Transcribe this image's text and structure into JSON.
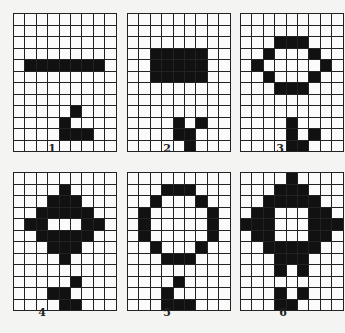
{
  "diagram": {
    "cols": 9,
    "rows": 12,
    "panels": [
      {
        "label": "1",
        "x": 13,
        "y": 13,
        "label_x": 52,
        "label_y": 150,
        "filled": [
          [
            4,
            1
          ],
          [
            4,
            2
          ],
          [
            4,
            3
          ],
          [
            4,
            4
          ],
          [
            4,
            5
          ],
          [
            4,
            6
          ],
          [
            4,
            7
          ],
          [
            8,
            5
          ],
          [
            9,
            4
          ],
          [
            10,
            4
          ],
          [
            10,
            5
          ],
          [
            10,
            6
          ]
        ]
      },
      {
        "label": "2",
        "x": 127,
        "y": 13,
        "label_x": 167,
        "label_y": 150,
        "filled": [
          [
            3,
            2
          ],
          [
            3,
            3
          ],
          [
            3,
            4
          ],
          [
            3,
            5
          ],
          [
            3,
            6
          ],
          [
            4,
            2
          ],
          [
            4,
            3
          ],
          [
            4,
            4
          ],
          [
            4,
            5
          ],
          [
            4,
            6
          ],
          [
            5,
            2
          ],
          [
            5,
            3
          ],
          [
            5,
            4
          ],
          [
            5,
            5
          ],
          [
            5,
            6
          ],
          [
            9,
            4
          ],
          [
            9,
            6
          ],
          [
            10,
            4
          ],
          [
            10,
            5
          ],
          [
            11,
            5
          ]
        ]
      },
      {
        "label": "3",
        "x": 240,
        "y": 13,
        "label_x": 280,
        "label_y": 150,
        "filled": [
          [
            2,
            3
          ],
          [
            2,
            4
          ],
          [
            2,
            5
          ],
          [
            3,
            2
          ],
          [
            3,
            6
          ],
          [
            4,
            1
          ],
          [
            4,
            7
          ],
          [
            5,
            2
          ],
          [
            5,
            6
          ],
          [
            6,
            3
          ],
          [
            6,
            4
          ],
          [
            6,
            5
          ],
          [
            9,
            4
          ],
          [
            10,
            4
          ],
          [
            10,
            6
          ],
          [
            11,
            4
          ],
          [
            11,
            5
          ]
        ]
      },
      {
        "label": "4",
        "x": 13,
        "y": 172,
        "label_x": 42,
        "label_y": 314,
        "filled": [
          [
            1,
            4
          ],
          [
            2,
            3
          ],
          [
            2,
            4
          ],
          [
            2,
            5
          ],
          [
            3,
            2
          ],
          [
            3,
            3
          ],
          [
            3,
            4
          ],
          [
            3,
            5
          ],
          [
            3,
            6
          ],
          [
            4,
            1
          ],
          [
            4,
            2
          ],
          [
            4,
            6
          ],
          [
            4,
            7
          ],
          [
            5,
            2
          ],
          [
            5,
            3
          ],
          [
            5,
            4
          ],
          [
            5,
            5
          ],
          [
            5,
            6
          ],
          [
            6,
            3
          ],
          [
            6,
            4
          ],
          [
            6,
            5
          ],
          [
            7,
            4
          ],
          [
            9,
            5
          ],
          [
            10,
            3
          ],
          [
            10,
            4
          ],
          [
            11,
            4
          ],
          [
            11,
            5
          ]
        ]
      },
      {
        "label": "5",
        "x": 127,
        "y": 172,
        "label_x": 167,
        "label_y": 314,
        "filled": [
          [
            1,
            3
          ],
          [
            1,
            4
          ],
          [
            1,
            5
          ],
          [
            2,
            2
          ],
          [
            2,
            6
          ],
          [
            3,
            1
          ],
          [
            3,
            7
          ],
          [
            4,
            1
          ],
          [
            4,
            7
          ],
          [
            5,
            1
          ],
          [
            5,
            7
          ],
          [
            6,
            2
          ],
          [
            6,
            6
          ],
          [
            7,
            3
          ],
          [
            7,
            4
          ],
          [
            7,
            5
          ],
          [
            9,
            4
          ],
          [
            10,
            3
          ],
          [
            11,
            3
          ],
          [
            11,
            4
          ],
          [
            11,
            5
          ]
        ]
      },
      {
        "label": "6",
        "x": 240,
        "y": 172,
        "label_x": 283,
        "label_y": 314,
        "filled": [
          [
            0,
            4
          ],
          [
            1,
            3
          ],
          [
            1,
            4
          ],
          [
            1,
            5
          ],
          [
            2,
            2
          ],
          [
            2,
            3
          ],
          [
            2,
            4
          ],
          [
            2,
            5
          ],
          [
            2,
            6
          ],
          [
            3,
            1
          ],
          [
            3,
            2
          ],
          [
            3,
            6
          ],
          [
            3,
            7
          ],
          [
            4,
            0
          ],
          [
            4,
            1
          ],
          [
            4,
            2
          ],
          [
            4,
            6
          ],
          [
            4,
            7
          ],
          [
            4,
            8
          ],
          [
            5,
            1
          ],
          [
            5,
            2
          ],
          [
            5,
            6
          ],
          [
            5,
            7
          ],
          [
            6,
            2
          ],
          [
            6,
            3
          ],
          [
            6,
            4
          ],
          [
            6,
            5
          ],
          [
            6,
            6
          ],
          [
            7,
            3
          ],
          [
            7,
            4
          ],
          [
            7,
            5
          ],
          [
            8,
            3
          ],
          [
            8,
            5
          ],
          [
            10,
            3
          ],
          [
            10,
            5
          ],
          [
            11,
            3
          ],
          [
            11,
            4
          ]
        ]
      }
    ],
    "colors": {
      "filled": "#111111",
      "empty": "#fbfbfb",
      "grid_line": "#222222",
      "background": "#f4f4f2"
    }
  }
}
